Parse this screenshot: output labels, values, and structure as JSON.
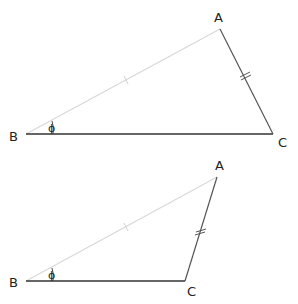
{
  "diagrams": [
    {
      "name": "triangle-1",
      "vertices": {
        "A": {
          "label": "A",
          "x": 220,
          "y": 29
        },
        "B": {
          "label": "B",
          "x": 26,
          "y": 134
        },
        "C": {
          "label": "C",
          "x": 273,
          "y": 134
        }
      },
      "labels": {
        "A": "A",
        "B": "B",
        "C": "C"
      },
      "angle_mark": "ϕ",
      "marks": {
        "AB": "single tick",
        "AC": "double tick"
      }
    },
    {
      "name": "triangle-2",
      "vertices": {
        "A": {
          "label": "A",
          "x": 217,
          "y": 177
        },
        "B": {
          "label": "B",
          "x": 26,
          "y": 281
        },
        "C": {
          "label": "C",
          "x": 185,
          "y": 281
        }
      },
      "labels": {
        "A": "A",
        "B": "B",
        "C": "C"
      },
      "angle_mark": "ϕ",
      "marks": {
        "AB": "single tick",
        "AC": "double tick"
      }
    }
  ],
  "colors": {
    "side_AB": "#d8d8d8",
    "side_BC": "#333333",
    "side_AC": "#555555",
    "text": "#222222"
  }
}
